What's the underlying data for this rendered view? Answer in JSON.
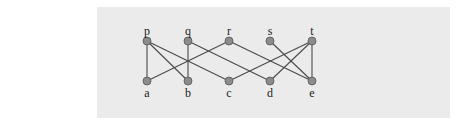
{
  "diagram": {
    "type": "bipartite-graph",
    "background": "#ebebeb",
    "node_color": "#8c8c8c",
    "edge_color": "#4a4a4a",
    "top_nodes": [
      {
        "id": "p",
        "label": "p",
        "x": 147,
        "y": 41
      },
      {
        "id": "q",
        "label": "q",
        "x": 188,
        "y": 41
      },
      {
        "id": "r",
        "label": "r",
        "x": 229,
        "y": 41
      },
      {
        "id": "s",
        "label": "s",
        "x": 270,
        "y": 41
      },
      {
        "id": "t",
        "label": "t",
        "x": 312,
        "y": 41
      }
    ],
    "bottom_nodes": [
      {
        "id": "a",
        "label": "a",
        "x": 147,
        "y": 81
      },
      {
        "id": "b",
        "label": "b",
        "x": 188,
        "y": 81
      },
      {
        "id": "c",
        "label": "c",
        "x": 229,
        "y": 81
      },
      {
        "id": "d",
        "label": "d",
        "x": 270,
        "y": 81
      },
      {
        "id": "e",
        "label": "e",
        "x": 312,
        "y": 81
      }
    ],
    "edges": [
      [
        "p",
        "a"
      ],
      [
        "p",
        "b"
      ],
      [
        "p",
        "c"
      ],
      [
        "q",
        "b"
      ],
      [
        "q",
        "d"
      ],
      [
        "r",
        "a"
      ],
      [
        "r",
        "e"
      ],
      [
        "s",
        "e"
      ],
      [
        "t",
        "c"
      ],
      [
        "t",
        "d"
      ],
      [
        "t",
        "e"
      ]
    ]
  }
}
